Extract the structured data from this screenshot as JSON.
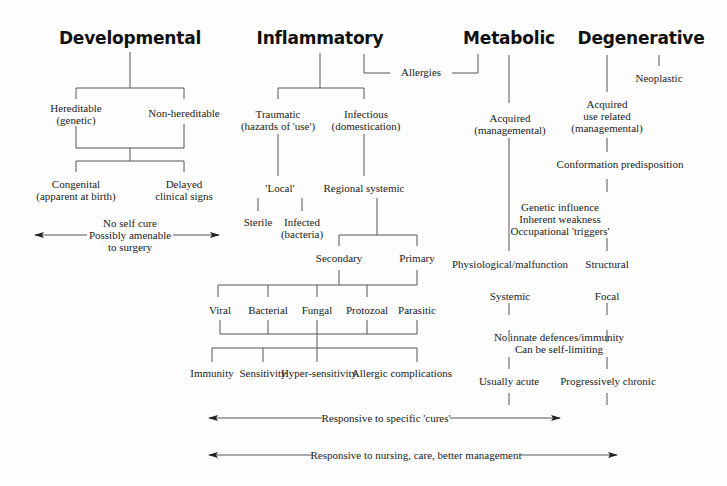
{
  "categories": {
    "developmental": "Developmental",
    "inflammatory": "Inflammatory",
    "metabolic": "Metabolic",
    "degenerative": "Degenerative"
  },
  "developmental": {
    "hereditable": "Hereditable\n(genetic)",
    "non_hereditable": "Non-hereditable",
    "congenital": "Congenital\n(apparent at birth)",
    "delayed": "Delayed\nclinical signs",
    "note": "No self cure\nPossibly amenable\nto surgery"
  },
  "inflammatory": {
    "allergies": "Allergies",
    "traumatic": "Traumatic\n(hazards of 'use')",
    "infectious": "Infectious\n(domestication)",
    "local": "'Local'",
    "regional_systemic": "Regional systemic",
    "sterile": "Sterile",
    "infected": "Infected\n(bacteria)",
    "secondary": "Secondary",
    "primary": "Primary",
    "agents": [
      "Viral",
      "Bacterial",
      "Fungal",
      "Protozoal",
      "Parasitic"
    ],
    "responses": [
      "Immunity",
      "Sensitivity",
      "Hyper-sensitivity",
      "Allergic complications"
    ]
  },
  "metabolic": {
    "acquired": "Acquired\n(managemental)",
    "genetic": "Genetic influence\nInherent weakness\nOccupational 'triggers'",
    "physiological": "Physiological/malfunction",
    "systemic": "Systemic",
    "innate": "No innate defences/immunity\nCan be self-limiting",
    "acute": "Usually acute"
  },
  "degenerative": {
    "neoplastic": "Neoplastic",
    "acquired_use": "Acquired\nuse related\n(managemental)",
    "conformation": "Conformation predisposition",
    "structural": "Structural",
    "focal": "Focal",
    "chronic": "Progressively chronic"
  },
  "footer": {
    "cures": "Responsive to specific 'cures'",
    "nursing": "Responsive to nursing, care, better management"
  }
}
